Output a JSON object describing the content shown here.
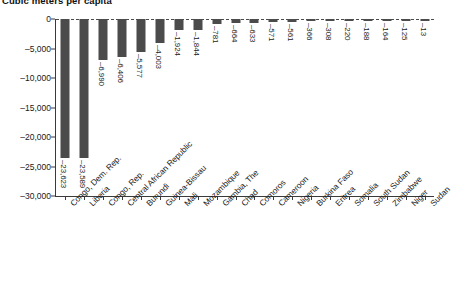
{
  "chart_data": {
    "type": "bar",
    "title": "Cubic meters per capita",
    "xlabel": "",
    "ylabel": "",
    "ylim": [
      -30000,
      0
    ],
    "yticks": [
      0,
      -5000,
      -10000,
      -15000,
      -20000,
      -25000,
      -30000
    ],
    "ytick_labels": [
      "0",
      "–5,000",
      "–10,000",
      "–15,000",
      "–20,000",
      "–25,000",
      "–30,000"
    ],
    "grid": false,
    "legend": "none",
    "bar_color": "#4b4b4b",
    "orientation": "vertical",
    "categories": [
      "Congo, Dem. Rep.",
      "Liberia",
      "Congo, Rep.",
      "Central African Republic",
      "Burundi",
      "Guinea-Bissau",
      "Mali",
      "Mozambique",
      "Gambia, The",
      "Chad",
      "Comoros",
      "Cameroon",
      "Nigeria",
      "Burkina Faso",
      "Eritrea",
      "Somalia",
      "South Sudan",
      "Zimbabwe",
      "Niger",
      "Sudan"
    ],
    "values": [
      -23623,
      -23589,
      -6990,
      -6406,
      -5577,
      -4003,
      -1924,
      -1844,
      -781,
      -664,
      -633,
      -571,
      -561,
      -366,
      -308,
      -220,
      -188,
      -164,
      -125,
      -13
    ],
    "data_labels": [
      "–23,623",
      "–23,589",
      "–6,990",
      "–6,406",
      "–5,577",
      "–4,003",
      "–1,924",
      "–1,844",
      "–781",
      "–664",
      "–633",
      "–571",
      "–561",
      "–366",
      "–308",
      "–220",
      "–188",
      "–164",
      "–125",
      "–13"
    ]
  }
}
